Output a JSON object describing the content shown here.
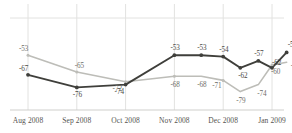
{
  "chart_data": {
    "type": "line",
    "title": "",
    "subtitle": "",
    "xlabel": "",
    "ylabel": "",
    "grid": true,
    "legend_position": "none",
    "categories": [
      "Aug 2008",
      "Sep 2008",
      "Oct 2008",
      "Nov 2008",
      "Dec 2008",
      "Jan 2009"
    ],
    "ylim": [
      -85,
      -45
    ],
    "series": [
      {
        "name": "dark-series",
        "color": "#3f3f3b",
        "x": [
          0,
          1,
          2,
          3,
          3.55,
          4,
          4.35,
          4.72,
          5.0,
          5.3
        ],
        "values": [
          -67,
          -76,
          -74,
          -53,
          -53,
          -54,
          -62,
          -57,
          -62,
          -51
        ],
        "labels": [
          "-67",
          "-76",
          "-74",
          "-53",
          "-53",
          "-54",
          "-62",
          "-57",
          "-62",
          "-51"
        ]
      },
      {
        "name": "light-series",
        "color": "#bdbdb8",
        "x": [
          0,
          1,
          2,
          3,
          3.55,
          4,
          4.35,
          4.72,
          5.0,
          5.3
        ],
        "values": [
          -53,
          -65,
          -72,
          -68,
          -68,
          -71,
          -79,
          -74,
          -60,
          -58
        ],
        "labels": [
          "-53",
          "-65",
          "-72",
          "-68",
          "-68",
          "-71",
          "-79",
          "-74",
          "-60",
          "-58"
        ]
      }
    ]
  },
  "axis": {
    "ticks": [
      {
        "label": "Aug 2008"
      },
      {
        "label": "Sep 2008"
      },
      {
        "label": "Oct 2008"
      },
      {
        "label": "Nov 2008"
      },
      {
        "label": "Dec 2008"
      },
      {
        "label": "Jan 2009"
      }
    ]
  },
  "colors": {
    "dark_line": "#3f3f3b",
    "light_line": "#bdbdb8",
    "gridline": "#e2e2e0",
    "axis_line": "#cfcfcc",
    "label_text": "#55544f"
  }
}
